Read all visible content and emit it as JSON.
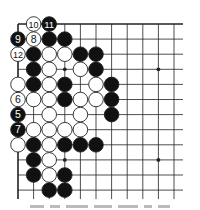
{
  "diagram": {
    "type": "go-board-diagram",
    "visible_columns": 11,
    "visible_rows": 12,
    "origin": {
      "x": 18,
      "y": 24
    },
    "spacing": {
      "x": 15.6,
      "y": 15.1
    },
    "edges": {
      "top": true,
      "left": true,
      "right": false,
      "bottom": false
    },
    "line_extension": 9,
    "colors": {
      "line": "#222222",
      "black_stone": "#111111",
      "white_stone": "#ffffff",
      "stone_outline": "#222222"
    },
    "hoshi": [
      [
        3,
        3
      ],
      [
        9,
        3
      ],
      [
        3,
        9
      ],
      [
        9,
        9
      ]
    ],
    "stones": [
      {
        "col": 1,
        "row": 0,
        "color": "white",
        "label": "10"
      },
      {
        "col": 2,
        "row": 0,
        "color": "black",
        "label": "11"
      },
      {
        "col": 0,
        "row": 1,
        "color": "black",
        "label": "9"
      },
      {
        "col": 1,
        "row": 1,
        "color": "white",
        "label": "8"
      },
      {
        "col": 2,
        "row": 1,
        "color": "black",
        "label": ""
      },
      {
        "col": 3,
        "row": 1,
        "color": "black",
        "label": ""
      },
      {
        "col": 0,
        "row": 2,
        "color": "white",
        "label": "12"
      },
      {
        "col": 1,
        "row": 2,
        "color": "black",
        "label": ""
      },
      {
        "col": 2,
        "row": 2,
        "color": "white",
        "label": ""
      },
      {
        "col": 3,
        "row": 2,
        "color": "white",
        "label": ""
      },
      {
        "col": 4,
        "row": 2,
        "color": "black",
        "label": ""
      },
      {
        "col": 5,
        "row": 2,
        "color": "black",
        "label": ""
      },
      {
        "col": 1,
        "row": 3,
        "color": "black",
        "label": ""
      },
      {
        "col": 2,
        "row": 3,
        "color": "white",
        "label": ""
      },
      {
        "col": 4,
        "row": 3,
        "color": "white",
        "label": ""
      },
      {
        "col": 5,
        "row": 3,
        "color": "black",
        "label": ""
      },
      {
        "col": 0,
        "row": 4,
        "color": "white",
        "label": ""
      },
      {
        "col": 1,
        "row": 4,
        "color": "black",
        "label": ""
      },
      {
        "col": 2,
        "row": 4,
        "color": "white",
        "label": ""
      },
      {
        "col": 3,
        "row": 4,
        "color": "black",
        "label": ""
      },
      {
        "col": 5,
        "row": 4,
        "color": "white",
        "label": ""
      },
      {
        "col": 6,
        "row": 4,
        "color": "black",
        "label": ""
      },
      {
        "col": 0,
        "row": 5,
        "color": "white",
        "label": "6"
      },
      {
        "col": 1,
        "row": 5,
        "color": "white",
        "label": ""
      },
      {
        "col": 2,
        "row": 5,
        "color": "white",
        "label": ""
      },
      {
        "col": 3,
        "row": 5,
        "color": "black",
        "label": ""
      },
      {
        "col": 4,
        "row": 5,
        "color": "white",
        "label": ""
      },
      {
        "col": 5,
        "row": 5,
        "color": "white",
        "label": ""
      },
      {
        "col": 6,
        "row": 5,
        "color": "black",
        "label": ""
      },
      {
        "col": 0,
        "row": 6,
        "color": "black",
        "label": "5"
      },
      {
        "col": 2,
        "row": 6,
        "color": "white",
        "label": ""
      },
      {
        "col": 4,
        "row": 6,
        "color": "white",
        "label": ""
      },
      {
        "col": 6,
        "row": 6,
        "color": "black",
        "label": ""
      },
      {
        "col": 0,
        "row": 7,
        "color": "black",
        "label": "7"
      },
      {
        "col": 1,
        "row": 7,
        "color": "white",
        "label": ""
      },
      {
        "col": 2,
        "row": 7,
        "color": "white",
        "label": ""
      },
      {
        "col": 3,
        "row": 7,
        "color": "white",
        "label": ""
      },
      {
        "col": 4,
        "row": 7,
        "color": "white",
        "label": ""
      },
      {
        "col": 0,
        "row": 8,
        "color": "white",
        "label": ""
      },
      {
        "col": 1,
        "row": 8,
        "color": "black",
        "label": ""
      },
      {
        "col": 2,
        "row": 8,
        "color": "white",
        "label": ""
      },
      {
        "col": 3,
        "row": 8,
        "color": "black",
        "label": ""
      },
      {
        "col": 4,
        "row": 8,
        "color": "black",
        "label": ""
      },
      {
        "col": 5,
        "row": 8,
        "color": "black",
        "label": ""
      },
      {
        "col": 1,
        "row": 9,
        "color": "black",
        "label": ""
      },
      {
        "col": 2,
        "row": 9,
        "color": "white",
        "label": ""
      },
      {
        "col": 1,
        "row": 10,
        "color": "black",
        "label": ""
      },
      {
        "col": 2,
        "row": 10,
        "color": "white",
        "label": ""
      },
      {
        "col": 3,
        "row": 10,
        "color": "black",
        "label": ""
      },
      {
        "col": 2,
        "row": 11,
        "color": "black",
        "label": ""
      },
      {
        "col": 3,
        "row": 11,
        "color": "black",
        "label": ""
      }
    ]
  }
}
